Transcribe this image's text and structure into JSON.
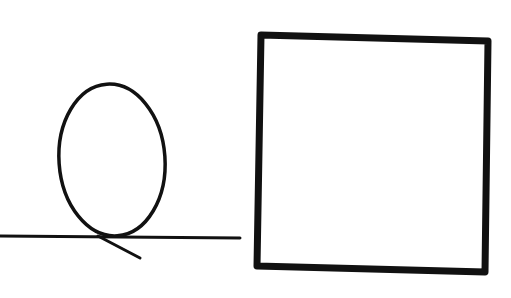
{
  "canvas": {
    "width": 511,
    "height": 298,
    "background": "#ffffff"
  },
  "colors": {
    "stroke": "#111111"
  },
  "shapes": [
    {
      "id": "ground-line",
      "type": "line"
    },
    {
      "id": "loop",
      "type": "ellipse"
    },
    {
      "id": "loop-tail",
      "type": "line"
    },
    {
      "id": "square",
      "type": "rect"
    }
  ]
}
